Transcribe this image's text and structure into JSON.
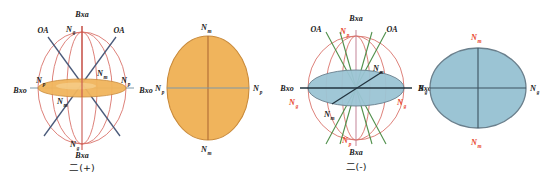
{
  "page": {
    "background": "#ffffff",
    "width": 544,
    "height": 176
  },
  "colors": {
    "orange_fill": "#f0b45c",
    "orange_edge": "#c98a3a",
    "blue_fill": "#9bc4d4",
    "blue_edge": "#6a7f8c",
    "meridian_salmon": "#d9736b",
    "oa_line_blue": "#4a5a7a",
    "oa_line_green": "#4f8f4a",
    "axis_dark": "#2b3a4a",
    "label_black": "#1a1a1a",
    "label_red": "#e8442c"
  },
  "figures": [
    {
      "id": "indicatrix-biaxial-positive",
      "type": "sphere-with-section",
      "caption": "二(+)",
      "fill": "#f0b45c",
      "labels": {
        "top_axis": "Bxa",
        "bottom_axis": "Bxa",
        "left_axis": "Bxo",
        "right_axis": "Bxo",
        "optic_axis_left": "OA",
        "optic_axis_right": "OA",
        "n_top": {
          "base": "N",
          "sub": "g"
        },
        "n_bottom": {
          "base": "N",
          "sub": "g"
        },
        "n_left": {
          "base": "N",
          "sub": "p"
        },
        "n_right": {
          "base": "N",
          "sub": "p"
        },
        "n_inner_upper": {
          "base": "N",
          "sub": "m"
        },
        "n_inner_lower": {
          "base": "N",
          "sub": "m"
        }
      }
    },
    {
      "id": "section-biaxial-positive",
      "type": "ellipse-section",
      "caption": "",
      "fill": "#f0b45c",
      "orientation": "vertical-long",
      "labels": {
        "n_top": {
          "base": "N",
          "sub": "m"
        },
        "n_bottom": {
          "base": "N",
          "sub": "m"
        },
        "n_left": {
          "base": "N",
          "sub": "p"
        },
        "n_right": {
          "base": "N",
          "sub": "p"
        }
      }
    },
    {
      "id": "indicatrix-biaxial-negative",
      "type": "sphere-with-section",
      "caption": "二(-)",
      "fill": "#9bc4d4",
      "labels": {
        "top_axis": "Bxa",
        "bottom_axis": "Bxa",
        "left_axis": "Bxo",
        "right_axis": "Bxo",
        "optic_axis_left": "OA",
        "optic_axis_right": "OA",
        "n_top": {
          "base": "N",
          "sub": "p"
        },
        "n_bottom": {
          "base": "N",
          "sub": "p"
        },
        "n_left": {
          "base": "N",
          "sub": "g"
        },
        "n_right": {
          "base": "N",
          "sub": "g"
        },
        "n_inner_upper": {
          "base": "N",
          "sub": "m"
        },
        "n_inner_lower": {
          "base": "N",
          "sub": "m"
        }
      }
    },
    {
      "id": "section-biaxial-negative",
      "type": "ellipse-section",
      "caption": "",
      "fill": "#9bc4d4",
      "orientation": "horizontal-long",
      "labels": {
        "n_top": {
          "base": "N",
          "sub": "m"
        },
        "n_bottom": {
          "base": "N",
          "sub": "m"
        },
        "n_left": {
          "base": "N",
          "sub": "g"
        },
        "n_right": {
          "base": "N",
          "sub": "g"
        }
      }
    }
  ]
}
